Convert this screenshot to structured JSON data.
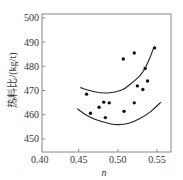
{
  "chart_data": {
    "type": "scatter",
    "title": "",
    "xlabel": "n",
    "ylabel": "热料比/(kg/t)",
    "xlim": [
      0.403,
      0.568
    ],
    "ylim": [
      444.6,
      501.6
    ],
    "x_ticks": [
      0.4,
      0.45,
      0.5,
      0.55
    ],
    "x_tick_labels": [
      "0.40",
      "0.45",
      "0.50",
      "0.55"
    ],
    "y_ticks": [
      450,
      460,
      470,
      480,
      490,
      500
    ],
    "y_tick_labels": [
      "450",
      "460",
      "470",
      "480",
      "490",
      "500"
    ],
    "grid": false,
    "legend": null,
    "series": [
      {
        "name": "data points",
        "kind": "scatter",
        "x": [
          0.46,
          0.465,
          0.476,
          0.482,
          0.489,
          0.484,
          0.507,
          0.508,
          0.521,
          0.521,
          0.525,
          0.532,
          0.538,
          0.535,
          0.547
        ],
        "y": [
          468.5,
          460.6,
          463.1,
          465.2,
          464.9,
          458.8,
          483.0,
          461.4,
          485.5,
          464.9,
          471.9,
          470.4,
          473.9,
          479.1,
          487.6
        ]
      },
      {
        "name": "upper bound curve",
        "kind": "line",
        "x": [
          0.452,
          0.47,
          0.487,
          0.505,
          0.517,
          0.528,
          0.535,
          0.541,
          0.546
        ],
        "y": [
          471.2,
          469.5,
          469.0,
          470.2,
          472.9,
          476.0,
          479.3,
          483.5,
          487.8
        ]
      },
      {
        "name": "lower bound curve",
        "kind": "line",
        "x": [
          0.448,
          0.46,
          0.475,
          0.49,
          0.5,
          0.515,
          0.527,
          0.542,
          0.555
        ],
        "y": [
          462.5,
          459.8,
          457.6,
          456.3,
          455.9,
          456.6,
          458.2,
          461.3,
          465.2
        ]
      }
    ]
  },
  "colors": {
    "axis": "#888888",
    "points": "#111111",
    "curves": "#222222",
    "text": "#333333"
  }
}
